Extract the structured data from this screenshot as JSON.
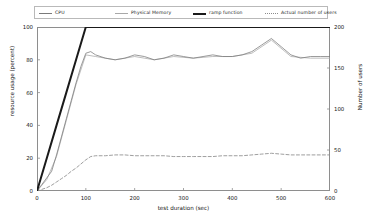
{
  "chart_data": {
    "type": "line",
    "title": "",
    "subtitle": "",
    "xlabel": "test duration (sec)",
    "ylabel": "resource usage (percent)",
    "ylabel_right": "Number of users",
    "xlim": [
      0,
      600
    ],
    "ylim": [
      0,
      100
    ],
    "ylim_right": [
      0,
      200
    ],
    "xticks": [
      0,
      100,
      200,
      300,
      400,
      500,
      600
    ],
    "yticks": [
      0,
      20,
      40,
      60,
      80,
      100
    ],
    "yticks_right": [
      0,
      50,
      100,
      150,
      200
    ],
    "grid": false,
    "legend_position": "above-plot-horizontal",
    "series": [
      {
        "name": "CPU",
        "axis": "left",
        "style": "solid-thin",
        "color": "#7a7a7a",
        "x": [
          0,
          10,
          20,
          30,
          40,
          50,
          60,
          70,
          80,
          90,
          100,
          110,
          120,
          140,
          160,
          180,
          200,
          220,
          240,
          260,
          280,
          300,
          320,
          340,
          360,
          380,
          400,
          420,
          440,
          460,
          480,
          500,
          520,
          540,
          560,
          580,
          600
        ],
        "y": [
          0,
          4,
          8,
          12,
          22,
          33,
          44,
          55,
          66,
          76,
          84,
          85,
          83,
          81,
          80,
          81,
          83,
          82,
          80,
          81,
          83,
          82,
          81,
          82,
          83,
          82,
          82,
          83,
          85,
          89,
          93,
          88,
          83,
          81,
          82,
          82,
          82
        ]
      },
      {
        "name": "Physical Memory",
        "axis": "left",
        "style": "solid-thin",
        "color": "#a8a8a8",
        "x": [
          0,
          20,
          40,
          60,
          80,
          100,
          120,
          160,
          200,
          240,
          280,
          320,
          360,
          400,
          440,
          480,
          520,
          560,
          600
        ],
        "y": [
          0,
          7,
          21,
          43,
          65,
          83,
          82,
          80,
          82,
          80,
          82,
          81,
          82,
          82,
          84,
          92,
          82,
          81,
          81
        ]
      },
      {
        "name": "ramp function",
        "axis": "left",
        "style": "solid-thick",
        "color": "#1a1a1a",
        "x": [
          0,
          20,
          40,
          60,
          80,
          100,
          200,
          300,
          400,
          500,
          600
        ],
        "y": [
          0,
          20,
          40,
          60,
          80,
          100,
          100,
          100,
          100,
          100,
          100
        ]
      },
      {
        "name": "Actual number of users",
        "axis": "right",
        "style": "dashed",
        "color": "#8c8c8c",
        "x": [
          0,
          10,
          20,
          30,
          40,
          50,
          60,
          70,
          80,
          90,
          100,
          110,
          120,
          140,
          160,
          180,
          200,
          220,
          240,
          260,
          280,
          300,
          320,
          340,
          360,
          380,
          400,
          420,
          440,
          460,
          480,
          500,
          520,
          540,
          560,
          580,
          600
        ],
        "y_right": [
          0,
          2,
          4,
          7,
          11,
          15,
          19,
          24,
          28,
          33,
          38,
          42,
          43,
          43,
          44,
          44,
          43,
          43,
          43,
          43,
          42,
          42,
          42,
          42,
          42,
          43,
          43,
          43,
          44,
          45,
          46,
          45,
          44,
          44,
          44,
          44,
          44
        ]
      }
    ],
    "legend": [
      {
        "label": "CPU",
        "style": "solid-thin",
        "color": "#7a7a7a"
      },
      {
        "label": "Physical Memory",
        "style": "solid-thin",
        "color": "#a8a8a8"
      },
      {
        "label": "ramp function",
        "style": "solid-thick",
        "color": "#1a1a1a"
      },
      {
        "label": "Actual number of users",
        "style": "dashed",
        "color": "#8c8c8c"
      }
    ],
    "annotations": []
  }
}
